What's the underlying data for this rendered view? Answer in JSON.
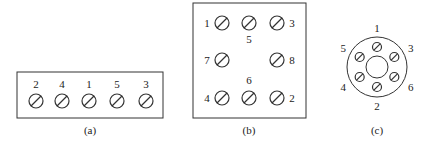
{
  "panels": [
    {
      "id": "a",
      "caption": "(a)",
      "layout": "terminal-strip",
      "terminals": [
        "2",
        "4",
        "1",
        "5",
        "3"
      ]
    },
    {
      "id": "b",
      "caption": "(b)",
      "layout": "square-block",
      "terminals": [
        "1",
        "5",
        "3",
        "7",
        "8",
        "4",
        "6",
        "2"
      ]
    },
    {
      "id": "c",
      "caption": "(c)",
      "layout": "circular-socket",
      "terminals": [
        "1",
        "3",
        "6",
        "2",
        "4",
        "5"
      ]
    }
  ],
  "colors": {
    "line": "#333333",
    "background": "#ffffff"
  }
}
